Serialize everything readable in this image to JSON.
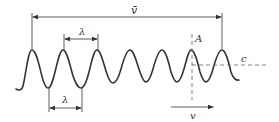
{
  "diagram": {
    "colors": {
      "line": "#333333",
      "dash": "#666666",
      "background": "#ffffff"
    },
    "labels": {
      "mean_velocity": "v̄",
      "wavelength_top": "λ",
      "wavelength_bottom": "λ",
      "point": "A",
      "crest_line": "c",
      "velocity": "v"
    },
    "wave": {
      "peaks_x": [
        32,
        63,
        97,
        130,
        162,
        191,
        222
      ],
      "peak_y": 50,
      "trough_y_left": 88,
      "trough_y_right": 82
    }
  }
}
